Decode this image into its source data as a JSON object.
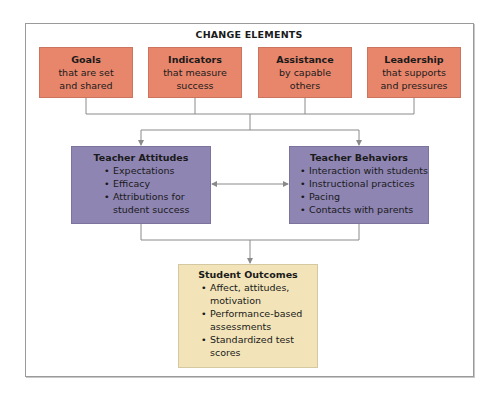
{
  "title": "CHANGE ELEMENTS",
  "colors": {
    "change_element": "#E8866C",
    "teacher": "#8E85B3",
    "outcome": "#F2E4B8",
    "connector": "#8a8a8a"
  },
  "change_elements": [
    {
      "heading": "Goals",
      "line1": "that are set",
      "line2": "and shared"
    },
    {
      "heading": "Indicators",
      "line1": "that measure",
      "line2": "success"
    },
    {
      "heading": "Assistance",
      "line1": "by capable",
      "line2": "others"
    },
    {
      "heading": "Leadership",
      "line1": "that supports",
      "line2": "and pressures"
    }
  ],
  "teacher_attitudes": {
    "heading": "Teacher Attitudes",
    "items": [
      "Expectations",
      "Efficacy",
      "Attributions for student success"
    ]
  },
  "teacher_behaviors": {
    "heading": "Teacher Behaviors",
    "items": [
      "Interaction with students",
      "Instructional practices",
      "Pacing",
      "Contacts with parents"
    ]
  },
  "student_outcomes": {
    "heading": "Student Outcomes",
    "items": [
      "Affect, attitudes, motivation",
      "Performance-based assessments",
      "Standardized test scores"
    ]
  }
}
